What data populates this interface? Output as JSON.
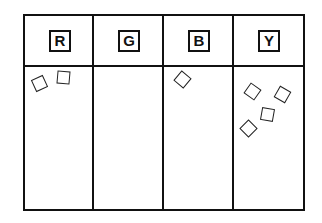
{
  "diagram": {
    "type": "sorting-tray",
    "columns": [
      {
        "label": "R",
        "chip_count": 2
      },
      {
        "label": "G",
        "chip_count": 0
      },
      {
        "label": "B",
        "chip_count": 1
      },
      {
        "label": "Y",
        "chip_count": 4
      }
    ],
    "chips": [
      {
        "column": "R",
        "x": 33,
        "y": 77,
        "rotate": -25
      },
      {
        "column": "R",
        "x": 57,
        "y": 71,
        "rotate": 5
      },
      {
        "column": "B",
        "x": 176,
        "y": 73,
        "rotate": 40
      },
      {
        "column": "Y",
        "x": 246,
        "y": 85,
        "rotate": 35
      },
      {
        "column": "Y",
        "x": 276,
        "y": 88,
        "rotate": 30
      },
      {
        "column": "Y",
        "x": 261,
        "y": 108,
        "rotate": 10
      },
      {
        "column": "Y",
        "x": 242,
        "y": 122,
        "rotate": 45
      }
    ],
    "colors": {
      "line": "#111111",
      "background": "#ffffff"
    }
  }
}
